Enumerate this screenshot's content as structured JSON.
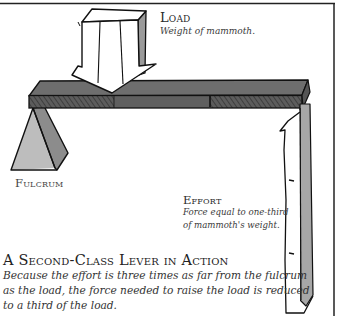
{
  "diagram": {
    "title": "A Second-Class Lever in Action",
    "description_lines": [
      "Because the effort is three times as far from the fulcrum",
      "as the load, the force needed to raise the load is reduced",
      "to a third of the load."
    ],
    "labels": {
      "load": {
        "title": "Load",
        "description": "Weight of mammoth."
      },
      "fulcrum": {
        "title": "Fulcrum"
      },
      "effort": {
        "title": "Effort",
        "description_lines": [
          "Force equal to one-third",
          "of mammoth's weight."
        ]
      }
    },
    "colors": {
      "beam_top": "#6e6e6e",
      "beam_front": "#5a5a5a",
      "fulcrum_light": "#bdbdbd",
      "fulcrum_dark": "#8c8c8c",
      "arrow_fill": "#ffffff",
      "arrow_shade": "#9a9a9a",
      "ink": "#111111"
    }
  }
}
